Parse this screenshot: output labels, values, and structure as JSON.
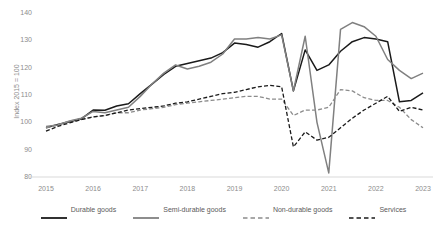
{
  "chart_data": {
    "type": "line",
    "title": "",
    "xlabel": "",
    "ylabel": "Index 2015 = 100",
    "ylim": [
      80,
      140
    ],
    "yticks": [
      80,
      90,
      100,
      110,
      120,
      130,
      140
    ],
    "ytick_labels": [
      "80",
      "90",
      "100",
      "110",
      "120",
      "130",
      "140"
    ],
    "xlim": [
      2015.0,
      2023.0
    ],
    "xticks": [
      2015,
      2016,
      2017,
      2018,
      2019,
      2020,
      2021,
      2022,
      2023
    ],
    "xtick_labels": [
      "2015",
      "2016",
      "2017",
      "2018",
      "2019",
      "2020",
      "2021",
      "2022",
      "2023"
    ],
    "grid": false,
    "legend_position": "bottom",
    "x": [
      2015.0,
      2015.25,
      2015.5,
      2015.75,
      2016.0,
      2016.25,
      2016.5,
      2016.75,
      2017.0,
      2017.25,
      2017.5,
      2017.75,
      2018.0,
      2018.25,
      2018.5,
      2018.75,
      2019.0,
      2019.25,
      2019.5,
      2019.75,
      2020.0,
      2020.25,
      2020.5,
      2020.75,
      2021.0,
      2021.25,
      2021.5,
      2021.75,
      2022.0,
      2022.25,
      2022.5,
      2022.75,
      2023.0
    ],
    "series": [
      {
        "name": "Durable goods",
        "color": "#1a1a1a",
        "style": "solid",
        "values": [
          98.0,
          99.2,
          100.2,
          101.3,
          104.5,
          104.4,
          106.0,
          106.8,
          110.5,
          114.0,
          117.5,
          120.5,
          121.5,
          122.5,
          123.5,
          125.5,
          129.0,
          128.5,
          127.5,
          129.5,
          132.5,
          111.5,
          126.5,
          119.0,
          121.0,
          126.0,
          129.5,
          131.0,
          130.5,
          129.5,
          107.5,
          108.0,
          110.8
        ]
      },
      {
        "name": "Semi-durable goods",
        "color": "#808080",
        "style": "solid",
        "values": [
          98.5,
          99.0,
          100.5,
          101.5,
          104.0,
          103.5,
          104.5,
          105.5,
          109.5,
          114.0,
          118.0,
          121.0,
          119.5,
          120.5,
          122.0,
          125.0,
          130.5,
          130.5,
          131.0,
          130.5,
          132.0,
          111.5,
          131.5,
          100.0,
          81.5,
          134.0,
          136.5,
          135.0,
          131.5,
          123.0,
          119.0,
          116.0,
          118.0
        ]
      },
      {
        "name": "Non-durable goods",
        "color": "#8c8c8c",
        "style": "dashed",
        "values": [
          98.0,
          99.0,
          100.5,
          101.0,
          102.0,
          102.5,
          103.5,
          103.5,
          104.5,
          105.0,
          105.5,
          106.5,
          107.0,
          107.5,
          108.0,
          108.5,
          109.0,
          109.5,
          109.5,
          108.5,
          108.5,
          102.5,
          104.5,
          104.5,
          105.5,
          112.0,
          111.5,
          109.0,
          108.0,
          108.0,
          105.5,
          101.0,
          98.0
        ]
      },
      {
        "name": "Services",
        "color": "#1a1a1a",
        "style": "dashed",
        "values": [
          96.8,
          98.5,
          99.8,
          101.0,
          102.0,
          102.5,
          103.5,
          104.5,
          105.0,
          105.5,
          106.0,
          107.0,
          107.5,
          108.5,
          109.5,
          110.5,
          111.0,
          112.0,
          113.0,
          113.5,
          113.0,
          91.0,
          96.5,
          93.5,
          94.5,
          98.0,
          101.5,
          104.5,
          107.0,
          109.5,
          104.0,
          105.5,
          104.5
        ]
      }
    ]
  },
  "legend": {
    "items": [
      {
        "label": "Durable goods"
      },
      {
        "label": "Semi-durable goods"
      },
      {
        "label": "Non-durable goods"
      },
      {
        "label": "Services"
      }
    ]
  }
}
